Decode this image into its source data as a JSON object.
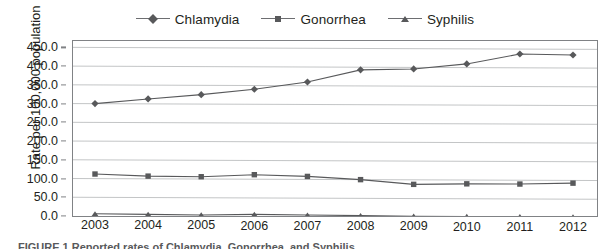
{
  "chart_data": {
    "type": "line",
    "title": "",
    "subtitle": "",
    "xlabel": "",
    "ylabel": "Rate per 100,000 population",
    "categories": [
      "2003",
      "2004",
      "2005",
      "2006",
      "2007",
      "2008",
      "2009",
      "2010",
      "2011",
      "2012"
    ],
    "x_tick_labels": [
      "2003",
      "2004",
      "2005",
      "2006",
      "2007",
      "2008",
      "2009",
      "2010",
      "2011",
      "2012"
    ],
    "y_tick_labels": [
      "0.0",
      "50.0",
      "100.0",
      "150.0",
      "200.0",
      "250.0",
      "300.0",
      "350.0",
      "400.0",
      "450.0"
    ],
    "y_ticks": [
      0,
      50,
      100,
      150,
      200,
      250,
      300,
      350,
      400,
      450
    ],
    "ylim": [
      0,
      467
    ],
    "y_axis_min": 0,
    "y_axis_max": 450,
    "y_tick_step": 50,
    "grid": "horizontal",
    "legend_position": "top-center",
    "series": [
      {
        "name": "Chlamydia",
        "marker": "diamond",
        "color": "#58595b",
        "values": [
          300,
          313,
          325,
          340,
          360,
          393,
          396,
          410,
          437,
          435
        ]
      },
      {
        "name": "Gonorrhea",
        "marker": "square",
        "color": "#58595b",
        "values": [
          112,
          107,
          106,
          112,
          108,
          100,
          88,
          90,
          90,
          93
        ]
      },
      {
        "name": "Syphilis",
        "marker": "triangle",
        "color": "#58595b",
        "values": [
          6,
          5,
          4,
          6,
          5,
          4,
          3,
          3,
          3,
          3
        ]
      }
    ]
  },
  "legend": {
    "entries": [
      {
        "label": "Chlamydia",
        "marker": "diamond"
      },
      {
        "label": "Gonorrhea",
        "marker": "square"
      },
      {
        "label": "Syphilis",
        "marker": "triangle"
      }
    ]
  },
  "axes": {
    "y_title": "Rate per 100,000 population"
  },
  "caption": {
    "text": "FIGURE 1 Reported rates of Chlamydia, Gonorrhea, and Syphilis"
  },
  "colors": {
    "series": "#58595b",
    "gridline": "#bcbec0",
    "axis": "#808285",
    "text": "#231f20",
    "background": "#ffffff"
  }
}
